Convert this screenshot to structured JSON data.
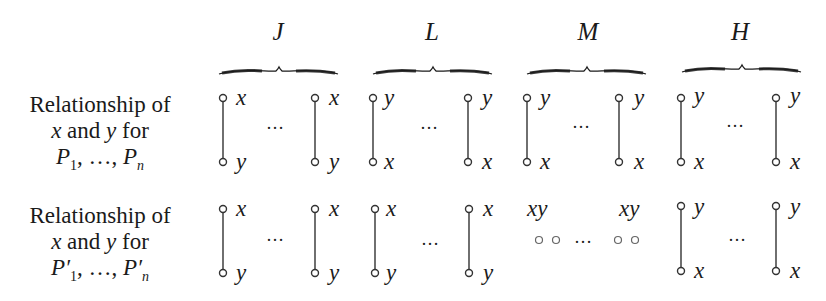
{
  "columns": [
    {
      "name": "J",
      "center": 278
    },
    {
      "name": "L",
      "center": 432
    },
    {
      "name": "M",
      "center": 588
    },
    {
      "name": "H",
      "center": 740
    }
  ],
  "rows": [
    {
      "label": [
        "Relationship of",
        "x and y for",
        "P1, ..., Pn"
      ],
      "cells": [
        {
          "column": "J",
          "top": "x",
          "bottom": "y",
          "connected": true
        },
        {
          "column": "L",
          "top": "y",
          "bottom": "x",
          "connected": true
        },
        {
          "column": "M",
          "top": "y",
          "bottom": "x",
          "connected": true
        },
        {
          "column": "H",
          "top": "y",
          "bottom": "x",
          "connected": true
        }
      ]
    },
    {
      "label": [
        "Relationship of",
        "x and y for",
        "P'1, ..., P'n"
      ],
      "cells": [
        {
          "column": "J",
          "top": "x",
          "bottom": "y",
          "connected": true
        },
        {
          "column": "L",
          "top": "x",
          "bottom": "y",
          "connected": true
        },
        {
          "column": "M",
          "top": "xy",
          "bottom": "",
          "connected": false
        },
        {
          "column": "H",
          "top": "y",
          "bottom": "x",
          "connected": true
        }
      ]
    }
  ],
  "text": {
    "row1_line1": "Relationship of",
    "row1_line2_x": "x",
    "row1_line2_mid": " and ",
    "row1_line2_y": "y",
    "row1_line2_end": " for",
    "row1_line3": "P",
    "row1_sub1": "1",
    "row1_mid": ", …, ",
    "row1_subn": "n",
    "row2_line1": "Relationship of",
    "row2_line2_x": "x",
    "row2_line2_mid": " and ",
    "row2_line2_y": "y",
    "row2_line2_end": " for",
    "row2_line3": "P′",
    "row2_sub1": "1",
    "row2_mid": ", …, ",
    "row2_subn": "n",
    "ellipsis": "…",
    "J": "J",
    "L": "L",
    "M": "M",
    "H": "H",
    "x": "x",
    "y": "y",
    "xy": "xy"
  }
}
